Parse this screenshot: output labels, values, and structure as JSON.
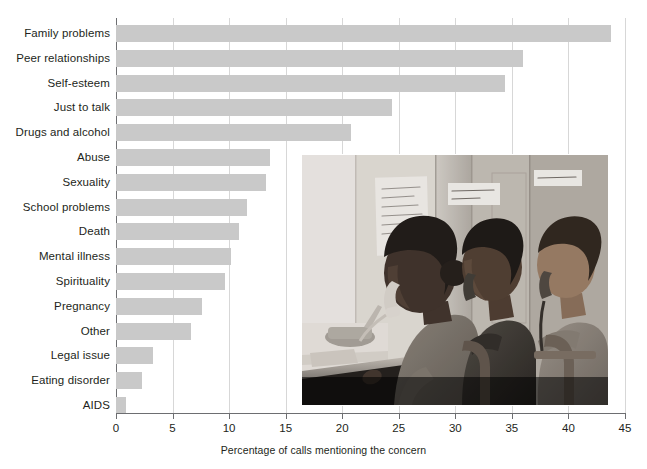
{
  "chart_data": {
    "type": "bar",
    "orientation": "horizontal",
    "title": "",
    "xlabel": "Percentage of calls mentioning the concern",
    "ylabel": "",
    "xlim": [
      0,
      45
    ],
    "xticks": [
      0,
      5,
      10,
      15,
      20,
      25,
      30,
      35,
      40,
      45
    ],
    "xtick_labels": [
      "0",
      "5",
      "10",
      "15",
      "20",
      "25",
      "30",
      "35",
      "40",
      "45"
    ],
    "grid": "vertical",
    "legend": "none",
    "bar_color": "#c9c9c9",
    "categories": [
      "Family problems",
      "Peer relationships",
      "Self-esteem",
      "Just to talk",
      "Drugs and alcohol",
      "Abuse",
      "Sexuality",
      "School problems",
      "Death",
      "Mental illness",
      "Spirituality",
      "Pregnancy",
      "Other",
      "Legal issue",
      "Eating disorder",
      "AIDS"
    ],
    "values": [
      43.8,
      36.0,
      34.4,
      24.4,
      20.8,
      13.6,
      13.3,
      11.6,
      10.9,
      10.2,
      9.6,
      7.6,
      6.6,
      3.3,
      2.3,
      0.9
    ]
  },
  "axis": {
    "x_title": "Percentage of calls mentioning the concern",
    "tick_labels": [
      "0",
      "5",
      "10",
      "15",
      "20",
      "25",
      "30",
      "35",
      "40",
      "45"
    ]
  },
  "photo": {
    "alt": "Three teen volunteers answering telephones at a crisis hotline call center",
    "wall_note_left": "Don't put your own feelings into their words. Ask them what they need to hear and ask them what helps.",
    "wall_note_middle": "LISTEN more, don't talk a lot!",
    "wall_note_right": "Smile and care!"
  }
}
